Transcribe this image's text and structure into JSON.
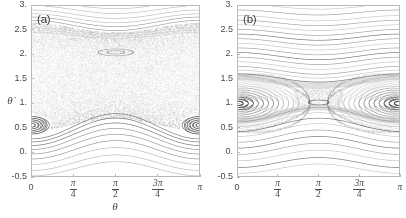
{
  "figure": {
    "caption_a": "(a)",
    "caption_b": "(b)"
  },
  "axes": {
    "xlabel": "θ",
    "ylabel": "θ̇",
    "ytick_labels": [
      "3.",
      "2.5",
      "2.",
      "1.5",
      "1.",
      "0.5",
      "0.",
      "-0.5"
    ],
    "ytick_values": [
      3.0,
      2.5,
      2.0,
      1.5,
      1.0,
      0.5,
      0.0,
      -0.5
    ],
    "xtick_labels": [
      "0",
      "π/4",
      "π/2",
      "3π/4",
      "π"
    ],
    "xtick_values": [
      0,
      0.7853981634,
      1.5707963268,
      2.3561944902,
      3.1415926536
    ],
    "xtick_parts": [
      {
        "whole": "0",
        "num": "",
        "den": ""
      },
      {
        "whole": "",
        "num": "π",
        "den": "4"
      },
      {
        "whole": "",
        "num": "π",
        "den": "2"
      },
      {
        "whole": "",
        "num": "3π",
        "den": "4"
      },
      {
        "whole": "π",
        "num": "",
        "den": ""
      }
    ],
    "xlim": [
      0,
      3.1415926536
    ],
    "ylim": [
      -0.5,
      3.0
    ]
  },
  "colors": {
    "frame": "#b9b9b9",
    "tick_text": "#4a4a4a",
    "orbit_dark": "#555555",
    "orbit_mid": "#7d7d7d",
    "orbit_light": "#a8a8a8",
    "chaos": "#8c8c8c",
    "background": "#ffffff"
  },
  "chart_data": [
    {
      "type": "scatter",
      "panel": "a",
      "title": "(a)",
      "xlabel": "θ",
      "ylabel": "θ̇",
      "xlim": [
        0,
        3.1415926536
      ],
      "ylim": [
        -0.5,
        3.0
      ],
      "grid": false,
      "legend": "none",
      "description": "Poincare surface of section of a driven pendulum. Large chaotic sea spanning approximately 0.45 < thetadot < 2.45 occupies most of the plot. Regular KAM rotational tori lie below thetadot = 0.45 and above thetadot = 2.45. Two small period-1 islands sit at theta = 0 and theta = pi centered near thetadot = 0.55. A small secondary island chain appears near theta = pi/2, thetadot = 2.05.",
      "features": {
        "chaotic_sea": {
          "ymin": 0.42,
          "ymax": 2.48,
          "point_density": "high"
        },
        "islands": [
          {
            "center_theta": 0.0,
            "center_thetadot": 0.55,
            "half_width_theta": 0.3,
            "half_width_thetadot": 0.18,
            "n_contours": 5
          },
          {
            "center_theta": 3.1415926536,
            "center_thetadot": 0.55,
            "half_width_theta": 0.3,
            "half_width_thetadot": 0.18,
            "n_contours": 5
          },
          {
            "center_theta": 1.5707963268,
            "center_thetadot": 2.05,
            "half_width_theta": 0.33,
            "half_width_thetadot": 0.07,
            "n_contours": 2
          }
        ],
        "lower_tori_levels": [
          0.4,
          0.33,
          0.25,
          0.16,
          0.06,
          -0.05,
          -0.17,
          -0.3,
          -0.42
        ],
        "lower_tori_amplitude": 0.26,
        "lower_tori_phase": "max_at_pi_over_2",
        "upper_tori_levels": [
          2.5,
          2.58,
          2.66,
          2.75,
          2.85,
          2.95
        ],
        "upper_tori_amplitude": 0.21,
        "upper_tori_phase": "min_at_pi_over_2"
      }
    },
    {
      "type": "scatter",
      "panel": "b",
      "title": "(b)",
      "xlabel": "θ",
      "ylabel": "θ̇",
      "xlim": [
        0,
        3.1415926536
      ],
      "ylim": [
        -0.5,
        3.0
      ],
      "grid": false,
      "legend": "none",
      "description": "Poincare surface of section with mostly regular motion. Two large resonant islands centered at theta = 0 and theta = pi at thetadot = 1.0 with many nested invariant curves. A separatrix X-point sits near theta = pi/2, thetadot = 1.15. Dense layered rotational tori fill the region above thetadot = 1.3 and below thetadot = 0.7. Thin stochastic layers line the separatrix.",
      "features": {
        "chaotic_sea": {
          "ymin": 0.0,
          "ymax": 0.0,
          "point_density": "none"
        },
        "islands": [
          {
            "center_theta": 0.0,
            "center_thetadot": 1.0,
            "half_width_theta": 1.1,
            "half_width_thetadot": 0.52,
            "n_contours": 12
          },
          {
            "center_theta": 3.1415926536,
            "center_thetadot": 1.0,
            "half_width_theta": 1.1,
            "half_width_thetadot": 0.52,
            "n_contours": 12
          },
          {
            "center_theta": 1.5707963268,
            "center_thetadot": 1.02,
            "half_width_theta": 0.2,
            "half_width_thetadot": 0.05,
            "n_contours": 1
          }
        ],
        "separatrix_x_point": {
          "theta": 1.5707963268,
          "thetadot": 1.16
        },
        "lower_tori_levels": [
          0.62,
          0.52,
          0.42,
          0.32,
          0.2,
          0.08,
          -0.05,
          -0.18,
          -0.32,
          -0.44
        ],
        "lower_tori_amplitude": 0.3,
        "lower_tori_phase": "max_at_pi_over_2",
        "upper_tori_levels": [
          1.44,
          1.52,
          1.6,
          1.7,
          1.8,
          1.9,
          2.0,
          2.1,
          2.2,
          2.3,
          2.4,
          2.5,
          2.6,
          2.7,
          2.82,
          2.94
        ],
        "upper_tori_amplitude": 0.17,
        "upper_tori_phase": "min_at_pi_over_2"
      }
    }
  ]
}
